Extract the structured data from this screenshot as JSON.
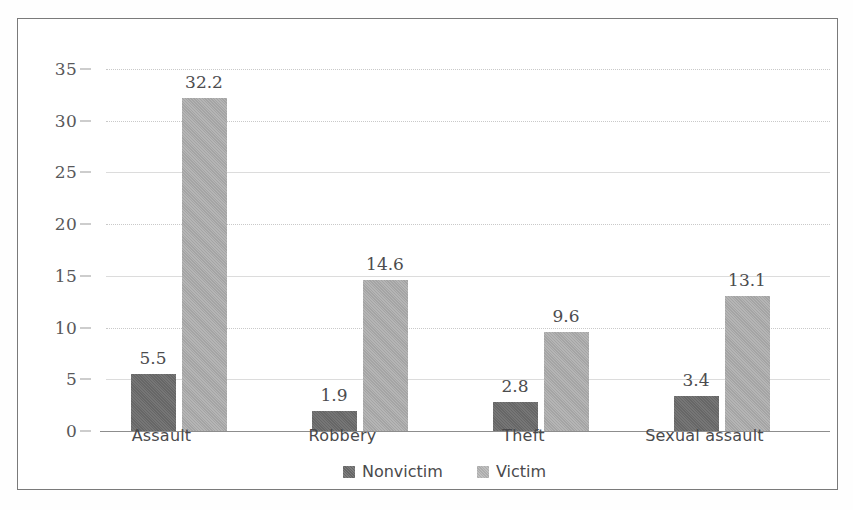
{
  "chart_data": {
    "type": "bar",
    "title": "",
    "subtitle": "",
    "xlabel": "",
    "ylabel": "",
    "categories": [
      "Assault",
      "Robbery",
      "Theft",
      "Sexual assault"
    ],
    "series": [
      {
        "name": "Nonvictim",
        "color": "#6c6c6c",
        "values": [
          5.5,
          1.9,
          2.8,
          3.4
        ],
        "labels": [
          "5.5",
          "1.9",
          "2.8",
          "3.4"
        ]
      },
      {
        "name": "Victim",
        "color": "#ababab",
        "values": [
          32.2,
          14.6,
          9.6,
          13.1
        ],
        "labels": [
          "32.2",
          "14.6",
          "9.6",
          "13.1"
        ]
      }
    ],
    "ylim": [
      0,
      35
    ],
    "yticks": [
      0,
      5,
      10,
      15,
      20,
      25,
      30,
      35
    ],
    "ytick_labels": [
      "0",
      "5",
      "10",
      "15",
      "20",
      "25",
      "30",
      "35"
    ],
    "grid": true,
    "grid_axis": "y",
    "legend_position": "bottom-center",
    "data_labels": true,
    "background_color": "#ffffff",
    "border_color": "#7a7a7a"
  }
}
